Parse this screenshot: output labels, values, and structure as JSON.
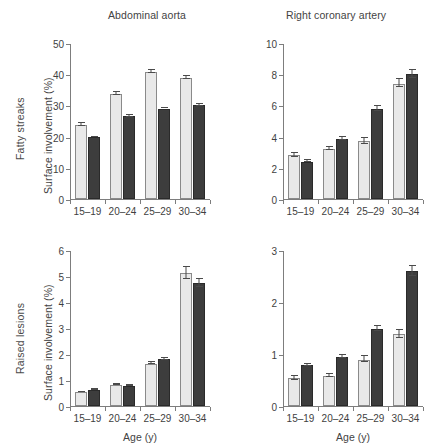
{
  "figure": {
    "column_titles": [
      "Abdominal aorta",
      "Right coronary artery"
    ],
    "row_labels": [
      "Fatty streaks",
      "Raised lesions"
    ],
    "xlabel": "Age (y)",
    "ylabel": "Surface involvement (%)",
    "colors": {
      "light_bar": "#e9e9e9",
      "dark_bar": "#3d3d3d",
      "axis": "#7d7d7d",
      "text": "#3f3f3f",
      "background": "#ffffff"
    },
    "series_names": [
      "light",
      "dark"
    ]
  },
  "chart_data": [
    {
      "type": "bar",
      "panel": "top-left",
      "title": "Abdominal aorta",
      "row": "Fatty streaks",
      "categories": [
        "15–19",
        "20–24",
        "25–29",
        "30–34"
      ],
      "series": [
        {
          "name": "light",
          "values": [
            23.7,
            33.8,
            40.7,
            38.8
          ],
          "errors": [
            1.4,
            1.3,
            1.4,
            1.3
          ]
        },
        {
          "name": "dark",
          "values": [
            19.8,
            26.5,
            29.0,
            30.1
          ],
          "errors": [
            0.4,
            0.8,
            0.6,
            0.9
          ]
        }
      ],
      "xlabel": "",
      "ylabel": "Surface involvement (%)",
      "ylim": [
        0,
        50
      ],
      "yticks": [
        0,
        10,
        20,
        30,
        40,
        50
      ],
      "grid": false,
      "legend": "none"
    },
    {
      "type": "bar",
      "panel": "top-right",
      "title": "Right coronary artery",
      "row": "Fatty streaks",
      "categories": [
        "15–19",
        "20–24",
        "25–29",
        "30–34"
      ],
      "series": [
        {
          "name": "light",
          "values": [
            2.8,
            3.2,
            3.7,
            7.4
          ],
          "errors": [
            0.35,
            0.3,
            0.45,
            0.55
          ]
        },
        {
          "name": "dark",
          "values": [
            2.4,
            3.85,
            5.75,
            8.0
          ],
          "errors": [
            0.15,
            0.3,
            0.4,
            0.55
          ]
        }
      ],
      "xlabel": "",
      "ylabel": "",
      "ylim": [
        0,
        10
      ],
      "yticks": [
        0,
        2,
        4,
        6,
        8,
        10
      ],
      "grid": false,
      "legend": "none"
    },
    {
      "type": "bar",
      "panel": "bottom-left",
      "title": "Abdominal aorta",
      "row": "Raised lesions",
      "categories": [
        "15–19",
        "20–24",
        "25–29",
        "30–34"
      ],
      "series": [
        {
          "name": "light",
          "values": [
            0.52,
            0.8,
            1.63,
            5.1
          ],
          "errors": [
            0.07,
            0.09,
            0.13,
            0.5
          ]
        },
        {
          "name": "dark",
          "values": [
            0.61,
            0.77,
            1.8,
            4.72
          ],
          "errors": [
            0.09,
            0.07,
            0.1,
            0.33
          ]
        }
      ],
      "xlabel": "Age (y)",
      "ylabel": "Surface involvement (%)",
      "ylim": [
        0,
        6
      ],
      "yticks": [
        0,
        1,
        2,
        3,
        4,
        5,
        6
      ],
      "grid": false,
      "legend": "none"
    },
    {
      "type": "bar",
      "panel": "bottom-right",
      "title": "Right coronary artery",
      "row": "Raised lesions",
      "categories": [
        "15–19",
        "20–24",
        "25–29",
        "30–34"
      ],
      "series": [
        {
          "name": "light",
          "values": [
            0.53,
            0.58,
            0.89,
            1.38
          ],
          "errors": [
            0.09,
            0.09,
            0.13,
            0.17
          ]
        },
        {
          "name": "dark",
          "values": [
            0.78,
            0.94,
            1.48,
            2.59
          ],
          "errors": [
            0.07,
            0.09,
            0.1,
            0.2
          ]
        }
      ],
      "xlabel": "Age (y)",
      "ylabel": "",
      "ylim": [
        0,
        3
      ],
      "yticks": [
        0,
        1,
        2,
        3
      ],
      "grid": false,
      "legend": "none"
    }
  ]
}
